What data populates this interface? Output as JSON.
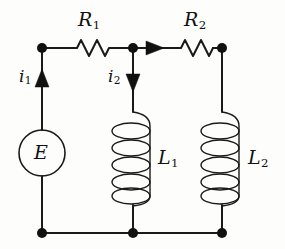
{
  "diagram": {
    "background_color": "#fdfdfb",
    "line_color": "#1a1a1a"
  },
  "labels": {
    "resistor_1": "R",
    "resistor_1_sub": "1",
    "resistor_2": "R",
    "resistor_2_sub": "2",
    "inductor_1": "L",
    "inductor_1_sub": "1",
    "inductor_2": "L",
    "inductor_2_sub": "2",
    "source": "E",
    "current_1": "i",
    "current_1_sub": "1",
    "current_2": "i",
    "current_2_sub": "2"
  },
  "components": [
    {
      "name": "voltage-source",
      "type": "circle-source",
      "label": "E",
      "cx": 42,
      "cy": 153,
      "r": 23
    },
    {
      "name": "resistor-r1",
      "type": "zigzag-resistor",
      "label": "R1",
      "x1": 72,
      "x2": 110,
      "y": 48
    },
    {
      "name": "resistor-r2",
      "type": "zigzag-resistor",
      "label": "R2",
      "x1": 176,
      "x2": 214,
      "y": 48
    },
    {
      "name": "inductor-l1",
      "type": "helix-coil",
      "label": "L1",
      "cx": 133,
      "y1": 112,
      "y2": 200,
      "turns": 5
    },
    {
      "name": "inductor-l2",
      "type": "helix-coil",
      "label": "L2",
      "cx": 222,
      "y1": 112,
      "y2": 200,
      "turns": 5
    }
  ],
  "nodes": [
    {
      "name": "node-top-left",
      "x": 42,
      "y": 48
    },
    {
      "name": "node-top-middle",
      "x": 133,
      "y": 48
    },
    {
      "name": "node-top-right",
      "x": 222,
      "y": 48
    },
    {
      "name": "node-bottom-left",
      "x": 42,
      "y": 233
    },
    {
      "name": "node-bottom-middle",
      "x": 133,
      "y": 233
    },
    {
      "name": "node-bottom-right",
      "x": 222,
      "y": 233
    }
  ],
  "current_arrows": [
    {
      "name": "current-arrow-i1",
      "label": "i1",
      "direction": "up",
      "x": 42,
      "y": 80
    },
    {
      "name": "current-arrow-i2",
      "label": "i2",
      "direction": "down",
      "x": 133,
      "y": 80
    },
    {
      "name": "current-arrow-branch",
      "label": "",
      "direction": "right",
      "x": 155,
      "y": 48
    }
  ]
}
